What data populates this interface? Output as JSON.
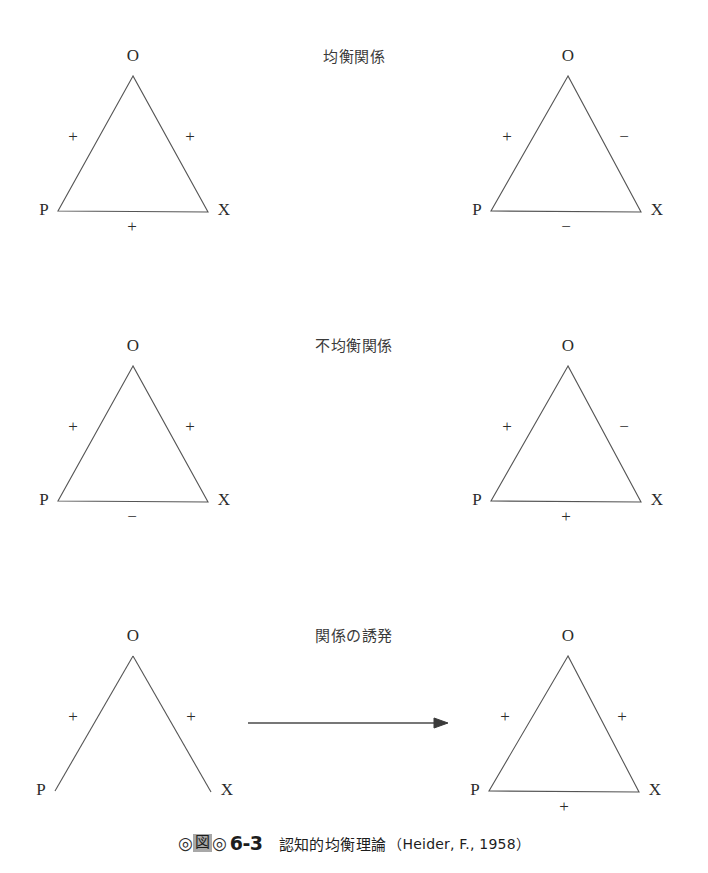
{
  "figure": {
    "caption": {
      "marker_left": "◎",
      "marker_box": "図",
      "marker_right": "◎",
      "number": "6-3",
      "title": "認知的均衡理論",
      "source": "（Heider, F., 1958）"
    },
    "row_labels": [
      {
        "id": "balanced",
        "text": "均衡関係"
      },
      {
        "id": "imbalanced",
        "text": "不均衡関係"
      },
      {
        "id": "induction",
        "text": "関係の誘発"
      }
    ],
    "node_labels": {
      "top": "O",
      "left": "P",
      "right": "X"
    },
    "signs": {
      "plus": "+",
      "minus": "−"
    },
    "diagrams": [
      {
        "id": "balanced-left",
        "row": "balanced",
        "shape": "triangle",
        "edges": {
          "po": "+",
          "ox": "+",
          "px": "+"
        }
      },
      {
        "id": "balanced-right",
        "row": "balanced",
        "shape": "triangle",
        "edges": {
          "po": "+",
          "ox": "−",
          "px": "−"
        }
      },
      {
        "id": "imbalanced-left",
        "row": "imbalanced",
        "shape": "triangle",
        "edges": {
          "po": "+",
          "ox": "+",
          "px": "−"
        }
      },
      {
        "id": "imbalanced-right",
        "row": "imbalanced",
        "shape": "triangle",
        "edges": {
          "po": "+",
          "ox": "−",
          "px": "+"
        }
      },
      {
        "id": "induction-left",
        "row": "induction",
        "shape": "open-vee",
        "edges": {
          "po": "+",
          "ox": "+",
          "px": ""
        }
      },
      {
        "id": "induction-right",
        "row": "induction",
        "shape": "triangle",
        "edges": {
          "po": "+",
          "ox": "+",
          "px": "+"
        }
      }
    ],
    "arrow": {
      "id": "induction-arrow",
      "direction": "right"
    },
    "colors": {
      "background": "#ffffff",
      "stroke": "#555555",
      "text": "#2b2b2b",
      "marker_box": "#a8a8a8"
    }
  }
}
